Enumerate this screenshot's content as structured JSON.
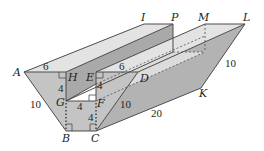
{
  "figure": {
    "type": "3d-prism-trough",
    "colors": {
      "top_face": "#e6e6e6",
      "front_face": "#bfbfbf",
      "inner_wall": "#a8a8a8",
      "right_slant": "#b3b3b3",
      "edge": "#4d4d4d",
      "background": "#ffffff"
    },
    "vertex_labels": {
      "A": "A",
      "B": "B",
      "C": "C",
      "D": "D",
      "E": "E",
      "F": "F",
      "G": "G",
      "H": "H",
      "I": "I",
      "K": "K",
      "L": "L",
      "M": "M",
      "P": "P"
    },
    "measurements": {
      "AH": "6",
      "ED": "6",
      "HG": "4",
      "EF_right": "4",
      "GF": "4",
      "FC": "4",
      "AB": "10",
      "CD": "10",
      "LK": "10",
      "CK": "20"
    }
  }
}
